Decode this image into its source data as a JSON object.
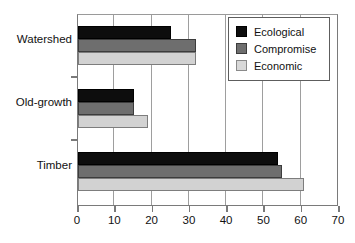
{
  "chart_data": {
    "type": "bar",
    "orientation": "horizontal",
    "title": "",
    "xlabel": "",
    "ylabel": "",
    "categories": [
      "Timber",
      "Old-growth",
      "Watershed"
    ],
    "category_order_top_to_bottom": [
      "Watershed",
      "Old-growth",
      "Timber"
    ],
    "series": [
      {
        "name": "Ecological",
        "color": "#0d0d0d",
        "values": [
          54,
          15,
          25
        ]
      },
      {
        "name": "Compromise",
        "color": "#6e6e6e",
        "values": [
          55,
          15,
          32
        ]
      },
      {
        "name": "Economic",
        "color": "#d2d2d2",
        "values": [
          61,
          19,
          32
        ]
      }
    ],
    "xlim": [
      0,
      70
    ],
    "xticks": [
      0,
      10,
      20,
      30,
      40,
      50,
      60,
      70
    ],
    "xtick_labels": [
      "0",
      "10",
      "20",
      "30",
      "40",
      "50",
      "60",
      "70"
    ],
    "grid": true,
    "grid_axis": "x",
    "legend_position": "top-right"
  },
  "legend": {
    "entries": [
      {
        "label": "Ecological",
        "swatch": "ecological"
      },
      {
        "label": "Compromise",
        "swatch": "compromise"
      },
      {
        "label": "Economic",
        "swatch": "economic"
      }
    ]
  }
}
